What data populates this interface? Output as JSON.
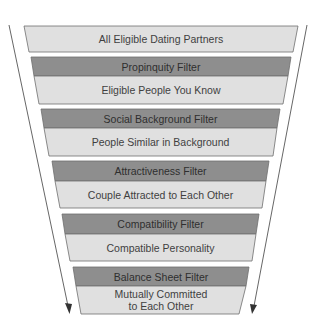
{
  "diagram": {
    "type": "funnel",
    "colors": {
      "stage_fill": "#e0e0e0",
      "filter_fill": "#8e8e8e",
      "outline": "#6e6e6e",
      "arrow": "#555555",
      "text": "#3f3f3f"
    },
    "top": {
      "label": "All Eligible Dating Partners"
    },
    "stages": [
      {
        "filter": "Propinquity Filter",
        "result": "Eligible People You Know"
      },
      {
        "filter": "Social Background Filter",
        "result": "People Similar in Background"
      },
      {
        "filter": "Attractiveness Filter",
        "result": "Couple Attracted to Each Other"
      },
      {
        "filter": "Compatibility Filter",
        "result": "Compatible Personality"
      },
      {
        "filter": "Balance Sheet Filter",
        "result_line1": "Mutually Committed",
        "result_line2": "to Each Other"
      }
    ]
  }
}
